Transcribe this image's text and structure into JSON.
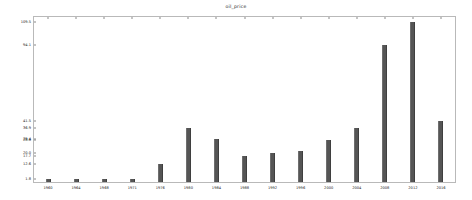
{
  "chart_data": {
    "type": "bar",
    "title": "oil_price",
    "xlabel": "",
    "ylabel": "",
    "grid": false,
    "legend": "none",
    "bar_color": "#555555",
    "frame_color": "#b9b9b9",
    "categories": [
      "1960",
      "1964",
      "1968",
      "1971",
      "1976",
      "1980",
      "1984",
      "1988",
      "1992",
      "1996",
      "2000",
      "2004",
      "2008",
      "2012",
      "2016"
    ],
    "values": [
      1.8,
      1.8,
      1.8,
      2.2,
      12.6,
      36.9,
      29.4,
      17.7,
      20.0,
      21.5,
      28.8,
      36.9,
      94.1,
      109.5,
      41.5
    ],
    "ylim": [
      0,
      113
    ],
    "yticks": [
      1.8,
      12.6,
      17.7,
      20.0,
      28.8,
      29.4,
      36.9,
      41.5,
      94.1,
      109.5
    ],
    "ytick_labels": [
      "1.8",
      "12.6",
      "17.7",
      "20.0",
      "28.8",
      "29.4",
      "36.9",
      "41.5",
      "94.1",
      "109.5"
    ]
  }
}
